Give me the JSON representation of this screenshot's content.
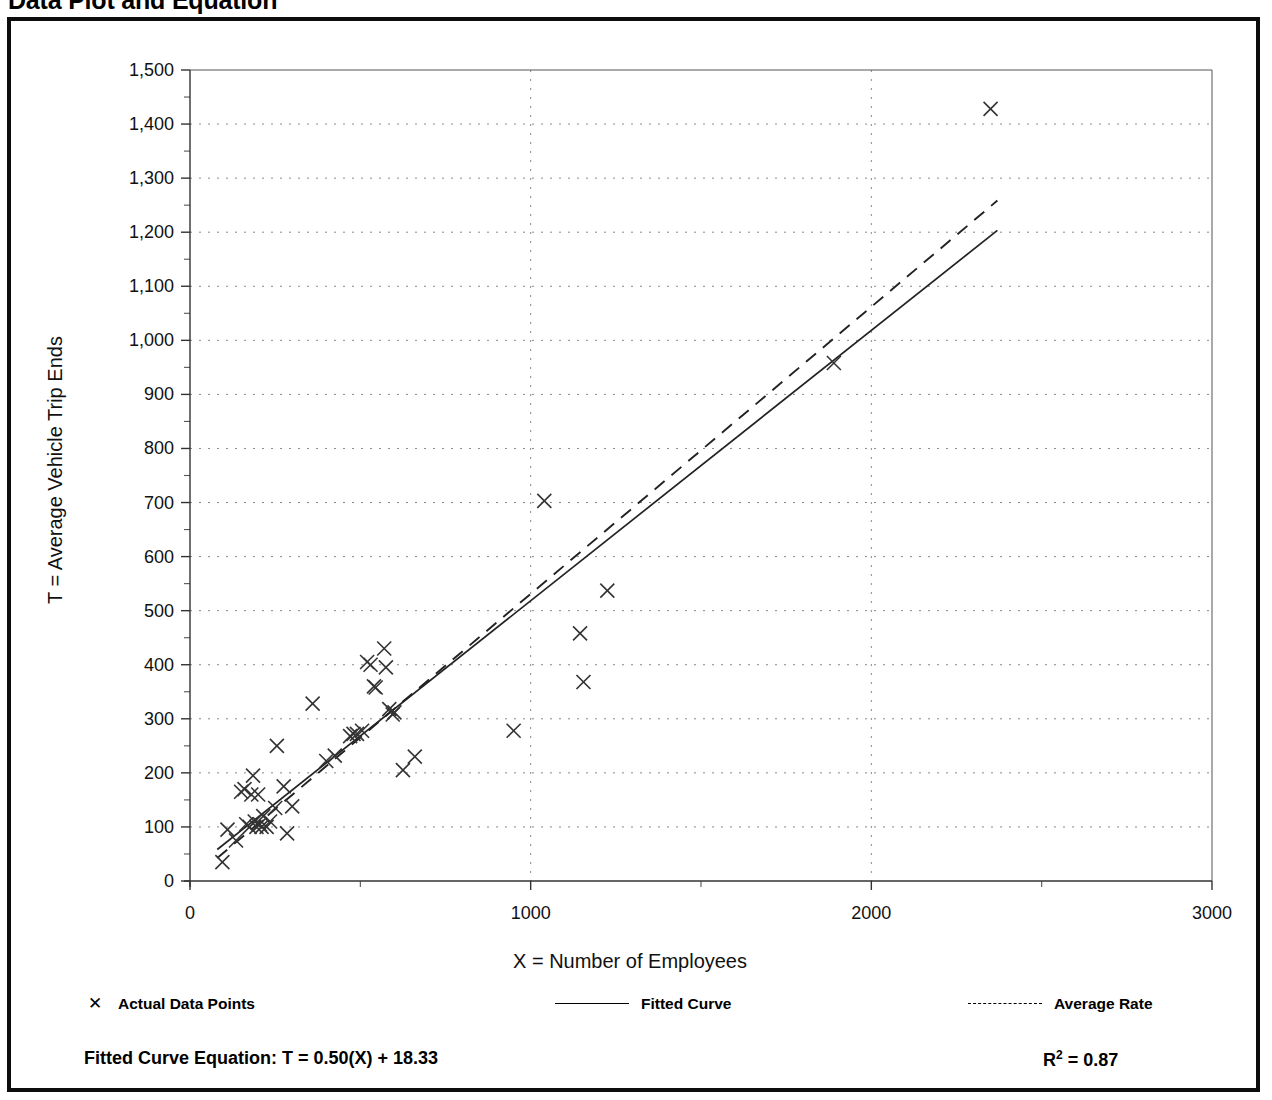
{
  "page": {
    "title": "Data Plot and Equation"
  },
  "chart_data": {
    "type": "scatter",
    "title": "Data Plot and Equation",
    "xlabel": "X = Number of Employees",
    "ylabel": "T = Average Vehicle Trip Ends",
    "xlim": [
      0,
      3000
    ],
    "ylim": [
      0,
      1500
    ],
    "xticks": [
      0,
      1000,
      2000,
      3000
    ],
    "xtick_labels": [
      "0",
      "1000",
      "2000",
      "3000"
    ],
    "yticks": [
      0,
      100,
      200,
      300,
      400,
      500,
      600,
      700,
      800,
      900,
      1000,
      1100,
      1200,
      1300,
      1400,
      1500
    ],
    "ytick_labels": [
      "0",
      "100",
      "200",
      "300",
      "400",
      "500",
      "600",
      "700",
      "800",
      "900",
      "1,000",
      "1,100",
      "1,200",
      "1,300",
      "1,400",
      "1,500"
    ],
    "grid": "dotted horizontal and vertical gridlines",
    "minor_ticks": true,
    "legend_position": "below plot",
    "legend": [
      {
        "label": "Actual Data Points",
        "marker": "x",
        "style": "marker"
      },
      {
        "label": "Fitted Curve",
        "marker": "line",
        "style": "solid"
      },
      {
        "label": "Average Rate",
        "marker": "line",
        "style": "dashed"
      }
    ],
    "series": [
      {
        "name": "Actual Data Points",
        "marker": "x",
        "points": [
          [
            95,
            35
          ],
          [
            110,
            95
          ],
          [
            135,
            75
          ],
          [
            150,
            165
          ],
          [
            160,
            170
          ],
          [
            165,
            105
          ],
          [
            175,
            100
          ],
          [
            180,
            160
          ],
          [
            185,
            195
          ],
          [
            190,
            110
          ],
          [
            195,
            100
          ],
          [
            200,
            160
          ],
          [
            205,
            105
          ],
          [
            210,
            100
          ],
          [
            215,
            120
          ],
          [
            225,
            100
          ],
          [
            235,
            110
          ],
          [
            250,
            135
          ],
          [
            255,
            250
          ],
          [
            275,
            175
          ],
          [
            285,
            88
          ],
          [
            300,
            138
          ],
          [
            360,
            328
          ],
          [
            400,
            222
          ],
          [
            425,
            232
          ],
          [
            470,
            268
          ],
          [
            480,
            272
          ],
          [
            490,
            272
          ],
          [
            505,
            278
          ],
          [
            520,
            405
          ],
          [
            530,
            400
          ],
          [
            540,
            360
          ],
          [
            545,
            358
          ],
          [
            570,
            430
          ],
          [
            575,
            395
          ],
          [
            585,
            318
          ],
          [
            595,
            308
          ],
          [
            600,
            312
          ],
          [
            625,
            205
          ],
          [
            660,
            230
          ],
          [
            950,
            278
          ],
          [
            1040,
            703
          ],
          [
            1145,
            458
          ],
          [
            1155,
            368
          ],
          [
            1225,
            537
          ],
          [
            1890,
            958
          ],
          [
            2350,
            1428
          ]
        ]
      },
      {
        "name": "Fitted Curve",
        "style": "solid",
        "equation": "T = 0.50(X) + 18.33",
        "slope": 0.5,
        "intercept": 18.33,
        "x_range": [
          80,
          2370
        ]
      },
      {
        "name": "Average Rate",
        "style": "dashed",
        "slope": 0.531,
        "intercept": 0,
        "x_range": [
          80,
          2370
        ]
      }
    ],
    "annotations": {
      "equation_label": "Fitted Curve Equation:  T = 0.50(X) + 18.33",
      "equation_prefix": "Fitted Curve Equation:",
      "equation_body": "T = 0.50(X) + 18.33",
      "r_squared_label": "R",
      "r_squared_exponent": "2",
      "r_squared_value": "= 0.87",
      "r_squared_full": "R2 = 0.87"
    },
    "colors": {
      "line": "#222222",
      "marker": "#333333",
      "grid": "#888888",
      "frame": "#0d0d0d"
    }
  }
}
